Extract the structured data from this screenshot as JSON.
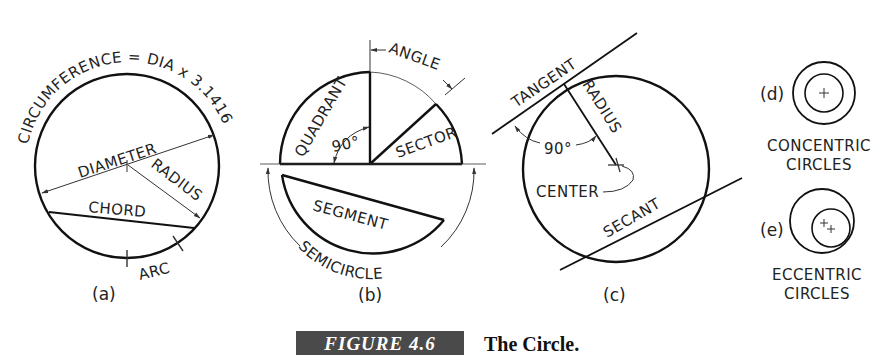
{
  "figure": {
    "number": "FIGURE 4.6",
    "title": "The Circle."
  },
  "panels": {
    "a": {
      "tag": "(a)",
      "circumference": "CIRCUMFERENCE = DIA x 3.1416",
      "diameter": "DIAMETER",
      "radius": "RADIUS",
      "chord": "CHORD",
      "arc": "ARC"
    },
    "b": {
      "tag": "(b)",
      "angle": "ANGLE",
      "quadrant": "QUADRANT",
      "right_angle": "90°",
      "sector": "SECTOR",
      "segment": "SEGMENT",
      "semicircle": "SEMICIRCLE"
    },
    "c": {
      "tag": "(c)",
      "tangent": "TANGENT",
      "radius": "RADIUS",
      "right_angle": "90°",
      "center": "CENTER",
      "secant": "SECANT"
    },
    "d": {
      "tag": "(d)",
      "label_line1": "CONCENTRIC",
      "label_line2": "CIRCLES"
    },
    "e": {
      "tag": "(e)",
      "label_line1": "ECCENTRIC",
      "label_line2": "CIRCLES"
    }
  }
}
